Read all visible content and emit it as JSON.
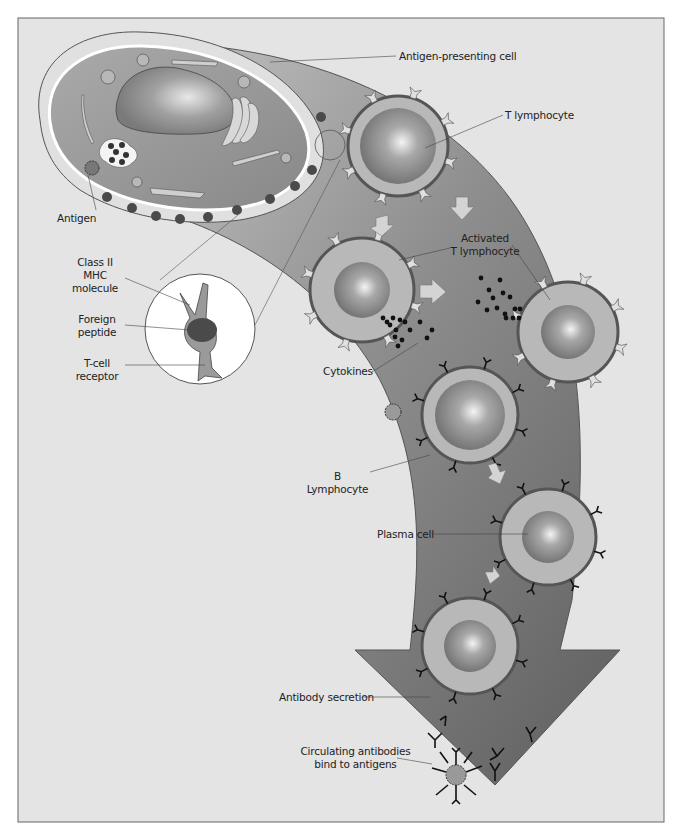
{
  "figure": {
    "type": "immune-response-diagram",
    "palette": {
      "background": "#e4e4e4",
      "arrow_light": "#bcbcbc",
      "arrow_dark": "#6e6e6e",
      "cell_ring": "#b4b4b4",
      "cell_border": "#555555",
      "nucleus": "#8c8c8c",
      "apc_body": "#9a9a9a",
      "frame_border": "#666666"
    }
  },
  "labels": {
    "antigen_presenting_cell": "Antigen-presenting cell",
    "t_lymphocyte": "T lymphocyte",
    "antigen": "Antigen",
    "activated_t_lymphocyte_line1": "Activated",
    "activated_t_lymphocyte_line2": "T lymphocyte",
    "class_ii_mhc_line1": "Class II",
    "class_ii_mhc_line2": "MHC",
    "class_ii_mhc_line3": "molecule",
    "foreign_peptide_line1": "Foreign",
    "foreign_peptide_line2": "peptide",
    "t_cell_receptor_line1": "T-cell",
    "t_cell_receptor_line2": "receptor",
    "cytokines": "Cytokines",
    "b_lymphocyte_line1": "B",
    "b_lymphocyte_line2": "Lymphocyte",
    "plasma_cell": "Plasma cell",
    "antibody_secretion": "Antibody secretion",
    "circulating_line1": "Circulating antibodies",
    "circulating_line2": "bind to antigens"
  }
}
